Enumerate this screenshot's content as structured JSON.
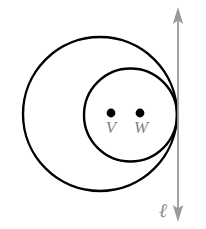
{
  "figure": {
    "background_color": "#ffffff",
    "stroke_color": "#000000",
    "label_color": "#808080",
    "line_color": "#999999",
    "dot_color": "#000000",
    "shapes": {
      "outer_circle": {
        "name": "outer-circle",
        "cx": 100,
        "cy": 114,
        "r": 77,
        "stroke_width": 2.4
      },
      "inner_circle": {
        "name": "inner-circle",
        "cx": 130.5,
        "cy": 115,
        "r": 46.5,
        "stroke_width": 2.4
      }
    },
    "points": [
      {
        "name": "point-v",
        "label": "V",
        "cx": 111,
        "cy": 113,
        "r": 4.4,
        "label_x": 111,
        "label_y": 133
      },
      {
        "name": "point-w",
        "label": "W",
        "cx": 140,
        "cy": 113,
        "r": 4.4,
        "label_x": 141,
        "label_y": 133
      }
    ],
    "tangent_line": {
      "name": "tangent-line",
      "label": "ℓ",
      "x": 178,
      "y_top": 10,
      "y_bottom": 219,
      "stroke_width": 1.6,
      "arrow_size": 7,
      "label_x": 162,
      "label_y": 216
    }
  }
}
